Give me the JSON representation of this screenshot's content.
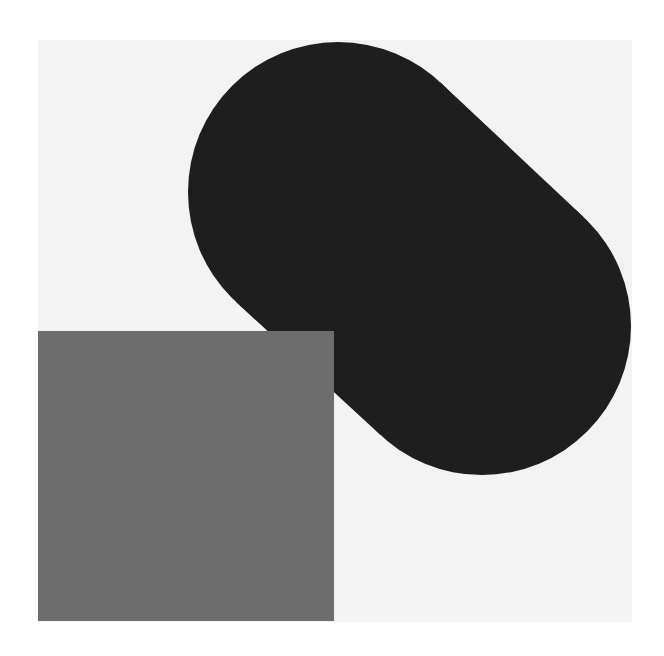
{
  "artwork": {
    "background_color": "#ffffff",
    "field_color": "#f3f3f3",
    "field": {
      "x": 38,
      "y": 40,
      "width": 594,
      "height": 582
    },
    "dark_shape_color": "#1e1e1e",
    "dark_shape": {
      "lobe1": {
        "cx": 338,
        "cy": 192,
        "r": 150
      },
      "lobe2": {
        "cx": 482,
        "cy": 326,
        "r": 149
      }
    },
    "gray_square_color": "#6d6d6d",
    "gray_square": {
      "x": 38,
      "y": 331,
      "width": 296,
      "height": 290
    }
  }
}
